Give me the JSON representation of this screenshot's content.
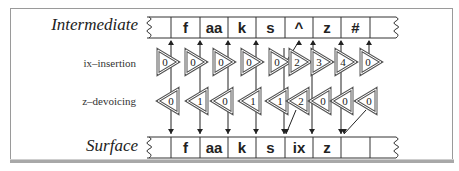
{
  "diagram": {
    "intermediate_tape": {
      "label": "Intermediate",
      "cells": [
        "",
        "f",
        "aa",
        "k",
        "s",
        "^",
        "z",
        "#",
        ""
      ]
    },
    "surface_tape": {
      "label": "Surface",
      "cells": [
        "",
        "f",
        "aa",
        "k",
        "s",
        "ix",
        "z",
        "",
        ""
      ]
    },
    "transducers": [
      {
        "label": "ix–insertion",
        "direction": "right",
        "states": [
          "0",
          "0",
          "0",
          "0",
          "0",
          "2",
          "3",
          "4",
          "0"
        ]
      },
      {
        "label": "z–devoicing",
        "direction": "left",
        "states": [
          "0",
          "1",
          "0",
          "1",
          "1",
          "2",
          "0",
          "0",
          "0"
        ]
      }
    ],
    "colors": {
      "line": "#222222",
      "triangle_border": "#555555",
      "frame": "#9a9a9a"
    }
  }
}
